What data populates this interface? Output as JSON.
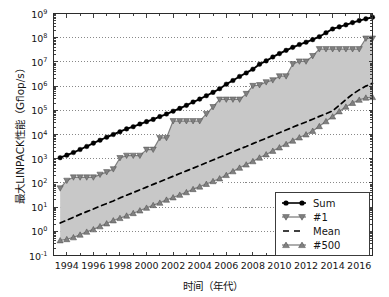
{
  "chart_data": {
    "type": "line",
    "title": "",
    "xlabel": "时间（年代）",
    "ylabel": "最大LINPACK性能（Gflop/s）",
    "xlim": [
      1993,
      2017
    ],
    "ylim": [
      0.1,
      1000000000
    ],
    "yscale": "log",
    "grid": true,
    "grid_style": "dotted",
    "legend_position": "lower right",
    "xticks": [
      1994,
      1996,
      1998,
      2000,
      2002,
      2004,
      2006,
      2008,
      2010,
      2012,
      2014,
      2016
    ],
    "xtick_labels": [
      "1994",
      "1996",
      "1998",
      "2000",
      "2002",
      "2004",
      "2006",
      "2008",
      "2010",
      "2012",
      "2014",
      "2016"
    ],
    "yticks": [
      0.1,
      1,
      10,
      100,
      1000,
      10000,
      100000,
      1000000,
      10000000,
      100000000,
      1000000000
    ],
    "ytick_labels": [
      "10-1",
      "100",
      "101",
      "102",
      "103",
      "104",
      "105",
      "106",
      "107",
      "108",
      "109"
    ],
    "ytick_mantissa": "10",
    "ytick_exponents": [
      "-1",
      "0",
      "1",
      "2",
      "3",
      "4",
      "5",
      "6",
      "7",
      "8",
      "9"
    ],
    "fill_between": {
      "lower_series": "#500",
      "upper_series": "#1",
      "color": "#c8c8c8"
    },
    "x": [
      1993.5,
      1994.0,
      1994.5,
      1995.0,
      1995.5,
      1996.0,
      1996.5,
      1997.0,
      1997.5,
      1998.0,
      1998.5,
      1999.0,
      1999.5,
      2000.0,
      2000.5,
      2001.0,
      2001.5,
      2002.0,
      2002.5,
      2003.0,
      2003.5,
      2004.0,
      2004.5,
      2005.0,
      2005.5,
      2006.0,
      2006.5,
      2007.0,
      2007.5,
      2008.0,
      2008.5,
      2009.0,
      2009.5,
      2010.0,
      2010.5,
      2011.0,
      2011.5,
      2012.0,
      2012.5,
      2013.0,
      2013.5,
      2014.0,
      2014.5,
      2015.0,
      2015.5,
      2016.0,
      2016.5,
      2017.0
    ],
    "series": [
      {
        "name": "Sum",
        "marker": "circle",
        "color": "#000000",
        "linestyle": "solid",
        "values": [
          1100,
          1400,
          1800,
          2400,
          3200,
          4400,
          5800,
          7700,
          10000,
          13000,
          17000,
          21000,
          27000,
          34000,
          42000,
          55000,
          70000,
          92000,
          120000,
          160000,
          220000,
          290000,
          400000,
          550000,
          780000,
          1200000,
          1700000,
          2500000,
          3500000,
          5000000,
          8000000,
          11000000,
          16000000,
          22000000,
          30000000,
          40000000,
          52000000,
          65000000,
          83000000,
          110000000,
          160000000,
          230000000,
          280000000,
          340000000,
          420000000,
          510000000,
          600000000,
          700000000
        ]
      },
      {
        "name": "#1",
        "marker": "triangle-down",
        "color": "#808080",
        "linestyle": "solid",
        "values": [
          60,
          124,
          170,
          170,
          170,
          170,
          220,
          280,
          370,
          1070,
          1340,
          1340,
          1340,
          2380,
          2380,
          7230,
          7230,
          35900,
          35900,
          35900,
          35900,
          35900,
          70700,
          136800,
          280600,
          280600,
          280600,
          280600,
          478200,
          1026000,
          1105000,
          1456000,
          1759000,
          2566000,
          2566000,
          8162000,
          10510000,
          10510000,
          17590000,
          33860000,
          33860000,
          33860000,
          33860000,
          33860000,
          33860000,
          33860000,
          93010000,
          93010000
        ]
      },
      {
        "name": "Mean",
        "marker": "none",
        "color": "#000000",
        "linestyle": "dashed",
        "values": [
          2.2,
          2.9,
          3.8,
          5.0,
          6.5,
          8.3,
          11,
          14,
          18,
          24,
          31,
          40,
          52,
          67,
          87,
          112,
          145,
          188,
          243,
          315,
          405,
          525,
          680,
          880,
          1150,
          1480,
          1920,
          2500,
          3200,
          4200,
          5400,
          7000,
          9100,
          11800,
          15300,
          20000,
          26000,
          33000,
          43000,
          56000,
          72000,
          94000,
          160000,
          280000,
          460000,
          700000,
          1000000,
          1300000
        ]
      },
      {
        "name": "#500",
        "marker": "triangle-up",
        "color": "#808080",
        "linestyle": "solid",
        "values": [
          0.42,
          0.47,
          0.56,
          0.72,
          0.95,
          1.2,
          1.6,
          2.1,
          2.8,
          3.5,
          4.4,
          5.6,
          7.2,
          9.3,
          12,
          15,
          20,
          25,
          32,
          41,
          55,
          70,
          90,
          117,
          152,
          210,
          300,
          420,
          570,
          780,
          1100,
          1500,
          2100,
          2900,
          4000,
          5500,
          7500,
          10000,
          14000,
          22000,
          35000,
          55000,
          90000,
          140000,
          200000,
          270000,
          330000,
          350000
        ]
      }
    ]
  },
  "legend": {
    "items": [
      {
        "label": "Sum"
      },
      {
        "label": "#1"
      },
      {
        "label": "Mean"
      },
      {
        "label": "#500"
      }
    ]
  },
  "colors": {
    "sum_line": "#000000",
    "band_fill": "#c8c8c8",
    "marker_gray": "#808080",
    "axis": "#2b2b2b",
    "grid": "#555555",
    "background": "#ffffff"
  }
}
